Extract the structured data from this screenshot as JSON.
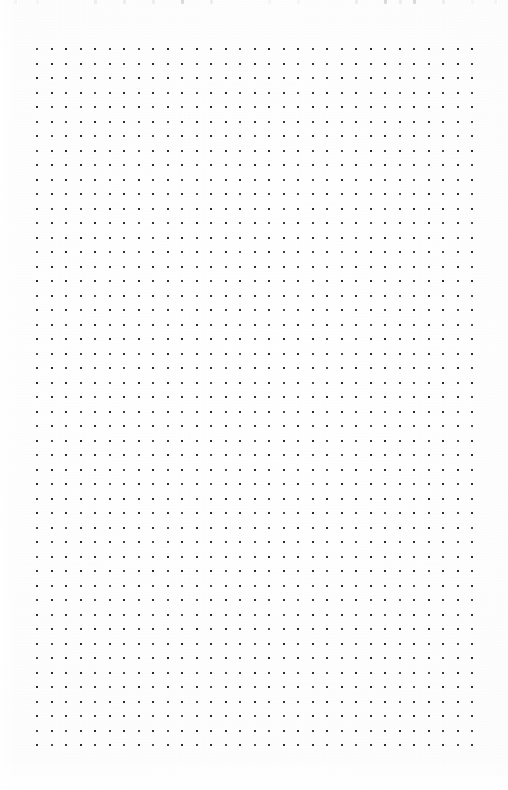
{
  "page": {
    "kind": "dot-grid-notebook-page",
    "width": 508,
    "height": 790,
    "paper_color": "#fefefe",
    "dot_color": "#262628"
  },
  "grid": {
    "columns": 31,
    "rows": 49,
    "spacing_px": 14.5,
    "dot_size_px": 2,
    "origin_x": 36,
    "origin_y": 48,
    "margin_left_px": 36,
    "margin_right_px": 37,
    "margin_top_px": 48,
    "margin_bottom_px": 39
  },
  "top_bleed": {
    "note": "faint partially-cropped dot marks along the top scan edge",
    "color_strong": "#d9d9dd",
    "color_faint": "#ededf0",
    "color_faintest": "#f5f5f7",
    "marks": [
      {
        "x": 14,
        "shade": "faintest"
      },
      {
        "x": 36,
        "shade": "faintest"
      },
      {
        "x": 94,
        "shade": "faint"
      },
      {
        "x": 123,
        "shade": "faint"
      },
      {
        "x": 152,
        "shade": "faint"
      },
      {
        "x": 181,
        "shade": "strong"
      },
      {
        "x": 210,
        "shade": "faint"
      },
      {
        "x": 268,
        "shade": "faintest"
      },
      {
        "x": 297,
        "shade": "faintest"
      },
      {
        "x": 355,
        "shade": "faint"
      },
      {
        "x": 384,
        "shade": "strong"
      },
      {
        "x": 399,
        "shade": "faint"
      },
      {
        "x": 413,
        "shade": "strong"
      },
      {
        "x": 442,
        "shade": "faint"
      },
      {
        "x": 471,
        "shade": "faintest"
      },
      {
        "x": 494,
        "shade": "faintest"
      }
    ]
  }
}
